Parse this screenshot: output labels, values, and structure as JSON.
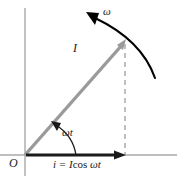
{
  "figure": {
    "labels": {
      "angular_velocity": "ω",
      "phasor_magnitude": "I",
      "angle": "ωt",
      "origin": "O",
      "equation_lhs": "i = I",
      "equation_cos": "cos",
      "equation_arg": "ωt"
    },
    "colors": {
      "axis": "#a8a8a8",
      "phasor": "#9a9a9a",
      "projection_arrow": "#1a1a1a",
      "arc": "#000000",
      "dashed": "#b0b0b0",
      "text": "#1a1a1a",
      "background": "#ffffff"
    },
    "geometry": {
      "origin_x": 25,
      "origin_y": 155,
      "phasor_tip_x": 125,
      "phasor_tip_y": 41,
      "projection_tip_x": 125,
      "vertical_axis_top_y": 8,
      "horizontal_axis_right_x": 177,
      "angle_degrees": 49
    }
  }
}
